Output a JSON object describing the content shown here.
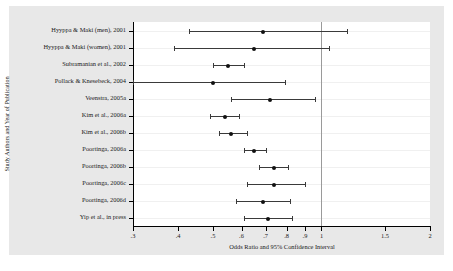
{
  "chart_data": {
    "type": "scatter",
    "subtype": "forest-plot",
    "title": "",
    "xlabel": "Odds Ratio and 95% Confidence Interval",
    "ylabel": "Study Authors and Year of Publication",
    "xscale": "log",
    "xlim": [
      0.3,
      2.0
    ],
    "xticks": [
      0.3,
      0.4,
      0.5,
      0.6,
      0.7,
      0.8,
      0.9,
      1,
      1.5,
      2
    ],
    "xticklabels": [
      ".3",
      ".4",
      ".5",
      ".6",
      ".7",
      ".8",
      ".9",
      "1",
      "1.5",
      "2"
    ],
    "reference_line": 1,
    "grid": "horizontal",
    "legend": "none",
    "categories": [
      "Hyyppa & Maki (men), 2001",
      "Hyyppa & Maki (women), 2001",
      "Subramanian et al., 2002",
      "Pollack & Knesebeck, 2004",
      "Veenstra, 2005a",
      "Kim et al., 2006a",
      "Kim et al., 2006b",
      "Poortinga, 2006a",
      "Poortinga, 2006b",
      "Poortinga, 2006c",
      "Poortinga, 2006d",
      "Yip et al., in press"
    ],
    "points": [
      {
        "study": "Hyyppa & Maki (men), 2001",
        "or": 0.69,
        "lo": 0.43,
        "hi": 1.18
      },
      {
        "study": "Hyyppa & Maki (women), 2001",
        "or": 0.65,
        "lo": 0.39,
        "hi": 1.05
      },
      {
        "study": "Subramanian et al., 2002",
        "or": 0.55,
        "lo": 0.5,
        "hi": 0.61
      },
      {
        "study": "Pollack & Knesebeck, 2004",
        "or": 0.5,
        "lo": 0.3,
        "hi": 0.79
      },
      {
        "study": "Veenstra, 2005a",
        "or": 0.72,
        "lo": 0.56,
        "hi": 0.96
      },
      {
        "study": "Kim et al., 2006a",
        "or": 0.54,
        "lo": 0.49,
        "hi": 0.59
      },
      {
        "study": "Kim et al., 2006b",
        "or": 0.56,
        "lo": 0.52,
        "hi": 0.62
      },
      {
        "study": "Poortinga, 2006a",
        "or": 0.65,
        "lo": 0.61,
        "hi": 0.7
      },
      {
        "study": "Poortinga, 2006b",
        "or": 0.74,
        "lo": 0.67,
        "hi": 0.81
      },
      {
        "study": "Poortinga, 2006c",
        "or": 0.74,
        "lo": 0.62,
        "hi": 0.9
      },
      {
        "study": "Poortinga, 2006d",
        "or": 0.69,
        "lo": 0.58,
        "hi": 0.82
      },
      {
        "study": "Yip et al., in press",
        "or": 0.71,
        "lo": 0.61,
        "hi": 0.83
      }
    ]
  },
  "colors": {
    "graph_region": "#e8e8e8",
    "plot_region": "#ffffff",
    "marker": "#111111",
    "ci": "#3a3a3a",
    "reference_line": "#9a9a9a",
    "gridline": "#f0f0f0",
    "axis": "#000000",
    "text": "#1a1a1a"
  }
}
